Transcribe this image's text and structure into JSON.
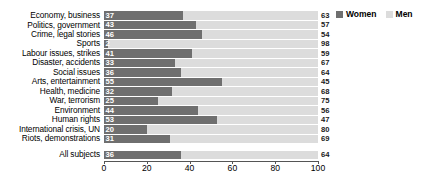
{
  "legend": {
    "position": "top-right",
    "entries": [
      {
        "label": "Women",
        "color": "#6f6f6f",
        "icon": "square-swatch-icon"
      },
      {
        "label": "Men",
        "color": "#dcdcdc",
        "icon": "square-swatch-icon"
      }
    ]
  },
  "axis": {
    "ticks": [
      "0",
      "20",
      "40",
      "60",
      "80",
      "100"
    ],
    "tick_values": [
      0,
      20,
      40,
      60,
      80,
      100
    ]
  },
  "chart_data": {
    "type": "bar",
    "orientation": "horizontal",
    "stacked": true,
    "stack_total": 100,
    "title": "",
    "subtitle": "",
    "xlabel": "",
    "ylabel": "",
    "xlim": [
      0,
      100
    ],
    "grid": false,
    "legend_position": "top-right",
    "categories": [
      "Economy, business",
      "Politics, government",
      "Crime, legal stories",
      "Sports",
      "Labour issues, strikes",
      "Disaster, accidents",
      "Social issues",
      "Arts, entertainment",
      "Health, medicine",
      "War, terrorism",
      "Environment",
      "Human rights",
      "International crisis, UN",
      "Riots, demonstrations",
      "All subjects"
    ],
    "series": [
      {
        "name": "Women",
        "color": "#6f6f6f",
        "values": [
          37,
          43,
          46,
          2,
          41,
          33,
          36,
          55,
          32,
          25,
          44,
          53,
          20,
          31,
          36
        ]
      },
      {
        "name": "Men",
        "color": "#dcdcdc",
        "values": [
          63,
          57,
          54,
          98,
          59,
          67,
          64,
          45,
          68,
          75,
          56,
          47,
          80,
          69,
          64
        ]
      }
    ]
  },
  "rows": [
    {
      "label": "Economy, business",
      "women": 37,
      "men": 63,
      "spaced": false
    },
    {
      "label": "Politics, government",
      "women": 43,
      "men": 57,
      "spaced": false
    },
    {
      "label": "Crime, legal stories",
      "women": 46,
      "men": 54,
      "spaced": false
    },
    {
      "label": "Sports",
      "women": 2,
      "men": 98,
      "spaced": false
    },
    {
      "label": "Labour issues, strikes",
      "women": 41,
      "men": 59,
      "spaced": false
    },
    {
      "label": "Disaster, accidents",
      "women": 33,
      "men": 67,
      "spaced": false
    },
    {
      "label": "Social issues",
      "women": 36,
      "men": 64,
      "spaced": false
    },
    {
      "label": "Arts, entertainment",
      "women": 55,
      "men": 45,
      "spaced": false
    },
    {
      "label": "Health, medicine",
      "women": 32,
      "men": 68,
      "spaced": false
    },
    {
      "label": "War, terrorism",
      "women": 25,
      "men": 75,
      "spaced": false
    },
    {
      "label": "Environment",
      "women": 44,
      "men": 56,
      "spaced": false
    },
    {
      "label": "Human rights",
      "women": 53,
      "men": 47,
      "spaced": false
    },
    {
      "label": "International crisis, UN",
      "women": 20,
      "men": 80,
      "spaced": false
    },
    {
      "label": "Riots, demonstrations",
      "women": 31,
      "men": 69,
      "spaced": false
    },
    {
      "label": "All subjects",
      "women": 36,
      "men": 64,
      "spaced": true
    }
  ]
}
